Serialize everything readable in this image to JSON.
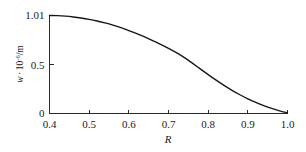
{
  "chart_data": {
    "type": "line",
    "title": "",
    "subtitle": "",
    "xlabel": "R",
    "ylabel": "w · 10⁻⁶/m",
    "ylabel_parts": {
      "symbol": "w",
      "separator": "·",
      "base": "10",
      "exponent": "-6",
      "unit": "/m"
    },
    "xlim": [
      0.4,
      1.0
    ],
    "ylim": [
      0,
      1.01
    ],
    "grid": false,
    "legend": null,
    "legend_position": "none",
    "axis_style": "L-shaped",
    "xticks": [
      0.4,
      0.5,
      0.6,
      0.7,
      0.8,
      0.9,
      1.0
    ],
    "xtick_labels": [
      "0.4",
      "0.5",
      "0.6",
      "0.7",
      "0.8",
      "0.9",
      "1.0"
    ],
    "yticks": [
      0,
      0.5,
      1.01
    ],
    "ytick_labels": [
      "0",
      "0.5",
      "1.01"
    ],
    "series": [
      {
        "name": "w",
        "color": "#161616",
        "x": [
          0.4,
          0.42,
          0.44,
          0.46,
          0.48,
          0.5,
          0.52,
          0.54,
          0.56,
          0.58,
          0.6,
          0.62,
          0.64,
          0.66,
          0.68,
          0.7,
          0.72,
          0.74,
          0.76,
          0.78,
          0.8,
          0.82,
          0.84,
          0.86,
          0.88,
          0.9,
          0.92,
          0.94,
          0.96,
          0.98,
          1.0
        ],
        "values": [
          1.01,
          1.008,
          1.003,
          0.995,
          0.984,
          0.97,
          0.953,
          0.933,
          0.91,
          0.884,
          0.855,
          0.823,
          0.789,
          0.752,
          0.713,
          0.672,
          0.627,
          0.576,
          0.519,
          0.46,
          0.401,
          0.344,
          0.29,
          0.239,
          0.193,
          0.151,
          0.114,
          0.081,
          0.053,
          0.028,
          0.006
        ]
      }
    ]
  },
  "colors": {
    "line": "#161616",
    "axis": "#2b2b2b",
    "text": "#1a1a1a",
    "background": "#ffffff"
  }
}
